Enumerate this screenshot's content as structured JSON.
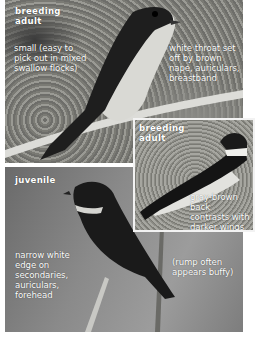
{
  "panels": {
    "top": {
      "title": "breeding\nadult",
      "note_left": "small (easy to\npick out in mixed\nswallow flocks)",
      "note_right": "white throat set\noff by brown\nnape, auriculars,\nbreastband"
    },
    "inset": {
      "title": "breeding\nadult",
      "note": "gray-brown back\ncontrasts with\ndarker wings"
    },
    "juvenile": {
      "title": "juvenile",
      "note_left": "narrow white\nedge on\nsecondaries,\nauriculars,\nforehead",
      "note_right": "(rump often\nappears buffy)"
    }
  }
}
